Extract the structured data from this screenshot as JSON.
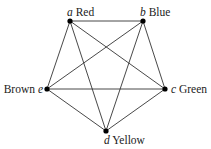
{
  "diagram": {
    "type": "complete-graph",
    "name": "K5",
    "edge_color": "#333333",
    "node_color": "#000000",
    "nodes": [
      {
        "id": "a",
        "color_label": "Red",
        "x": 70,
        "y": 21
      },
      {
        "id": "b",
        "color_label": "Blue",
        "x": 143,
        "y": 21
      },
      {
        "id": "c",
        "color_label": "Green",
        "x": 165,
        "y": 89
      },
      {
        "id": "d",
        "color_label": "Yellow",
        "x": 106,
        "y": 131
      },
      {
        "id": "e",
        "color_label": "Brown",
        "x": 47,
        "y": 89
      }
    ],
    "edges": [
      [
        "a",
        "b"
      ],
      [
        "a",
        "c"
      ],
      [
        "a",
        "d"
      ],
      [
        "a",
        "e"
      ],
      [
        "b",
        "c"
      ],
      [
        "b",
        "d"
      ],
      [
        "b",
        "e"
      ],
      [
        "c",
        "d"
      ],
      [
        "c",
        "e"
      ],
      [
        "d",
        "e"
      ]
    ]
  }
}
